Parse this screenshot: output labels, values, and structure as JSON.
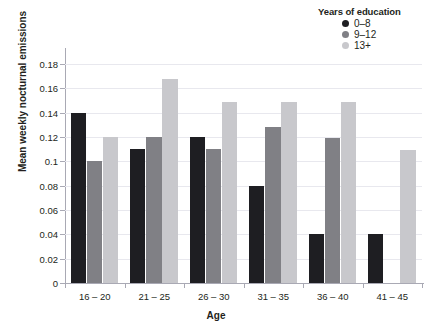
{
  "chart_data": {
    "type": "bar",
    "title": "",
    "subtitle": "",
    "xlabel": "Age",
    "ylabel": "Mean weekly nocturnal emissions",
    "categories": [
      "16 – 20",
      "21 – 25",
      "26 – 30",
      "31 – 35",
      "36 – 40",
      "41 – 45"
    ],
    "series": [
      {
        "name": "0–8",
        "color": "#1e1e22",
        "values": [
          0.14,
          0.11,
          0.12,
          0.08,
          0.04,
          0.04
        ]
      },
      {
        "name": "9–12",
        "color": "#808085",
        "values": [
          0.1,
          0.12,
          0.11,
          0.128,
          0.119,
          0
        ]
      },
      {
        "name": "13+",
        "color": "#c8c8cc",
        "values": [
          0.12,
          0.168,
          0.149,
          0.149,
          0.149,
          0.109
        ]
      }
    ],
    "ylim": [
      0,
      0.19
    ],
    "yticks": [
      0,
      0.02,
      0.04,
      0.06,
      0.08,
      0.1,
      0.12,
      0.14,
      0.16,
      0.18
    ],
    "ytick_labels": [
      "0",
      "0.02",
      "0.04",
      "0.06",
      "0.08",
      "0.1",
      "0.12",
      "0.14",
      "0.16",
      "0.18"
    ],
    "grid": true,
    "legend_position": "top-right",
    "grouping": "grouped"
  },
  "legend": {
    "title": "Years of education",
    "entries": [
      {
        "label": "0–8",
        "color": "#1e1e22"
      },
      {
        "label": "9–12",
        "color": "#808085"
      },
      {
        "label": "13+",
        "color": "#c8c8cc"
      }
    ]
  },
  "axes": {
    "x_title": "Age",
    "y_title": "Mean weekly nocturnal emissions"
  },
  "colors": {
    "background": "#ffffff",
    "gridline": "#e8e8ee",
    "axis": "#a9a9b4",
    "text": "#231f20"
  }
}
